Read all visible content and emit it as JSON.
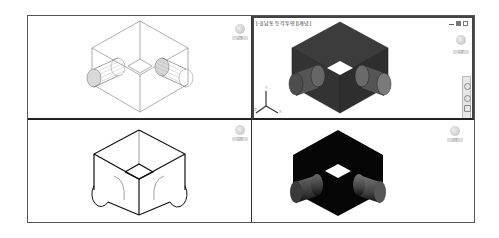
{
  "viewports": {
    "top_left": {
      "style": "wireframe",
      "viewcube_label": "남동"
    },
    "top_right": {
      "active": true,
      "label": "[-][남동 등각투영][개념]",
      "viewcube_label": "남동",
      "window_controls": [
        "minimize",
        "maximize",
        "close"
      ],
      "ucs_axes": [
        "Y",
        "Z",
        "X"
      ],
      "style": "conceptual-shaded"
    },
    "bottom_left": {
      "style": "hidden-line",
      "viewcube_label": "남동"
    },
    "bottom_right": {
      "style": "realistic-shaded",
      "viewcube_label": "남동"
    }
  },
  "colors": {
    "viewport_border": "#444444",
    "solid_dark": "#3a3a3a",
    "solid_black": "#050505",
    "wire": "#666666"
  }
}
